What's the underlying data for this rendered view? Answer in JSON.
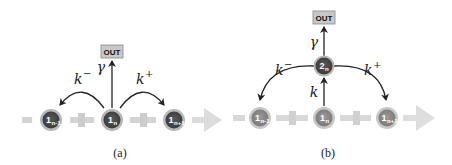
{
  "panels": [
    {
      "caption": "(a)",
      "out_label": "OUT",
      "gamma_label": "γ",
      "k_minus": {
        "base": "k",
        "sup": "−"
      },
      "k_plus": {
        "base": "k",
        "sup": "+"
      },
      "nodes": [
        {
          "main": "1",
          "sub": "n-1"
        },
        {
          "main": "1",
          "sub": "n"
        },
        {
          "main": "1",
          "sub": "n+1"
        }
      ]
    },
    {
      "caption": "(b)",
      "out_label": "OUT",
      "gamma_label": "γ",
      "k_label": "k",
      "k_minus": {
        "base": "k",
        "sup": "−"
      },
      "k_plus": {
        "base": "k",
        "sup": "+"
      },
      "top_node": {
        "main": "2",
        "sub": "n"
      },
      "nodes": [
        {
          "main": "1",
          "sub": "n-1"
        },
        {
          "main": "1",
          "sub": "n"
        },
        {
          "main": "1",
          "sub": "n+1"
        }
      ]
    }
  ],
  "colors": {
    "track": "#d4d4d4",
    "track_arrow": "#dcdcdc",
    "node_dark": "#4a4a4a",
    "node_ring": "#b8b8b8",
    "node_light": "#8c8c8c",
    "node_light_ring": "#c8c8c8",
    "out_fill": "#c8c8c8",
    "arrow": "#222222"
  }
}
